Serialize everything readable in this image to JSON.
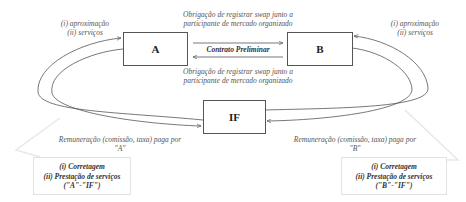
{
  "nodes": {
    "a": {
      "label": "A"
    },
    "b": {
      "label": "B"
    },
    "if": {
      "label": "IF"
    }
  },
  "labels": {
    "left_top": {
      "line1": "(i) aproximação",
      "line2": "(ii) serviços"
    },
    "right_top": {
      "line1": "(i) aproximação",
      "line2": "(ii) serviços"
    },
    "top_center": {
      "line1": "Obrigação de registrar swap junto a",
      "line2": "participante de mercado organizado"
    },
    "middle": "Contrato Preliminar",
    "bottom_center": {
      "line1": "Obrigação de registrar swap junto a",
      "line2": "participante de mercado organizado"
    },
    "left_remuneration": {
      "line1": "Remuneração (comissão, taxa) paga por",
      "line2": "\"A\""
    },
    "right_remuneration": {
      "line1": "Remuneração (comissão, taxa) paga por",
      "line2": "\"B\""
    }
  },
  "callouts": {
    "left": {
      "line1": "(i) Corretagem",
      "line2": "(ii) Prestação de serviços",
      "line3": "(\"A\"-\"IF\")"
    },
    "right": {
      "line1": "(i) Corretagem",
      "line2": "(ii) Prestação de serviços",
      "line3": "(\"B\"-\"IF\")"
    }
  },
  "colors": {
    "line": "#555555",
    "callout_border": "#e2e2e2"
  }
}
